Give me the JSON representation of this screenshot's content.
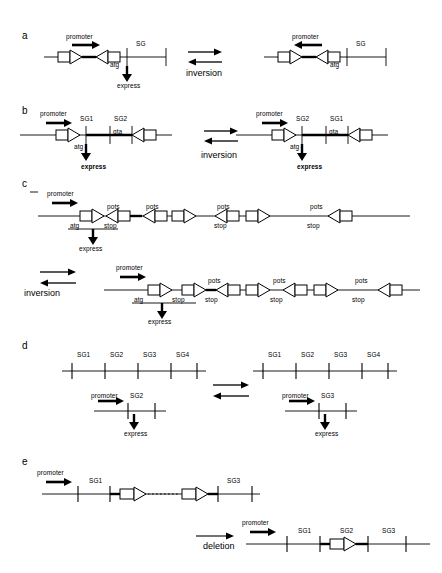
{
  "figure": {
    "background": "#ffffff",
    "ink": "#000000",
    "width": 442,
    "height": 573
  },
  "panels": [
    {
      "id": "a",
      "letter": "a",
      "operation": "inversion",
      "left_state": {
        "promoter_label": "promoter",
        "promoter_direction": "right",
        "segment_label": "SG",
        "start_codon": "atg",
        "expression_label": "express",
        "expressed": true
      },
      "right_state": {
        "promoter_label": "promoter",
        "promoter_direction": "left",
        "segment_label": "SG",
        "start_codon": "atg",
        "expressed": false
      }
    },
    {
      "id": "b",
      "letter": "b",
      "operation": "inversion",
      "left_state": {
        "promoter_label": "promoter",
        "promoter_direction": "right",
        "segments": [
          "SG1",
          "SG2"
        ],
        "start_codon": "atg",
        "reverse_codon": "gta",
        "expression_label": "express"
      },
      "right_state": {
        "promoter_label": "promoter",
        "promoter_direction": "right",
        "segments": [
          "SG2",
          "SG1"
        ],
        "start_codon": "atg",
        "reverse_codon": "gta",
        "expression_label": "express"
      }
    },
    {
      "id": "c",
      "letter": "c",
      "operation": "inversion",
      "top_state": {
        "promoter_label": "promoter",
        "promoter_direction": "right",
        "start_codon": "atg",
        "stop_above": "pots",
        "stop_below": "stop",
        "expression_label": "express",
        "arrow_orientations": [
          "right",
          "left",
          "left",
          "right",
          "left",
          "right",
          "left"
        ],
        "above_labels": [
          "pots",
          "pots",
          "pots",
          "pots"
        ],
        "below_labels": [
          "stop",
          "stop",
          "stop"
        ]
      },
      "bottom_state": {
        "promoter_label": "promoter",
        "promoter_direction": "right",
        "start_codon": "atg",
        "expression_label": "express",
        "arrow_orientations": [
          "right",
          "right",
          "left",
          "right",
          "left",
          "right",
          "left"
        ],
        "above_labels": [
          "pots",
          "pots",
          "pots"
        ],
        "below_labels": [
          "stop",
          "stop",
          "stop",
          "stop"
        ]
      }
    },
    {
      "id": "d",
      "letter": "d",
      "operation": "inversion",
      "left_state": {
        "segments": [
          "SG1",
          "SG2",
          "SG3",
          "SG4"
        ],
        "tick_count": 5,
        "promoter_label": "promoter",
        "promoter_direction": "right",
        "selected_segment": "SG2",
        "expression_label": "express"
      },
      "right_state": {
        "segments": [
          "SG1",
          "SG2",
          "SG3",
          "SG4"
        ],
        "tick_count": 5,
        "promoter_label": "promoter",
        "promoter_direction": "right",
        "selected_segment": "SG3",
        "expression_label": "express"
      }
    },
    {
      "id": "e",
      "letter": "e",
      "operation": "deletion",
      "top_state": {
        "promoter_label": "promoter",
        "promoter_direction": "right",
        "segments": [
          "SG1",
          "SG3"
        ],
        "has_dotted_link": true,
        "arrow_orientations": [
          "right",
          "right"
        ]
      },
      "bottom_state": {
        "promoter_label": "promoter",
        "promoter_direction": "right",
        "segments": [
          "SG1",
          "SG2",
          "SG3"
        ],
        "arrow_orientations": [
          "right"
        ]
      }
    }
  ],
  "operations": {
    "inversion": "inversion",
    "deletion": "deletion"
  },
  "common_labels": {
    "promoter": "promoter",
    "express": "express",
    "atg": "atg",
    "gta": "gta",
    "stop": "stop",
    "pots": "pots"
  }
}
